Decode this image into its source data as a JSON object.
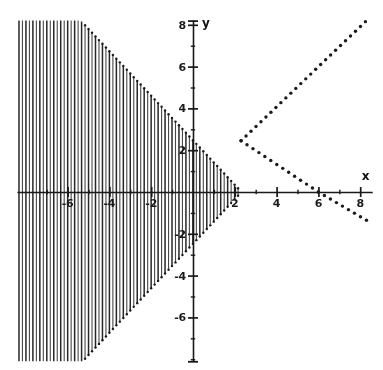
{
  "figure": {
    "kind": "math-plot",
    "background_color": "#ffffff",
    "ink_color": "#1a1a1a",
    "width": 383,
    "height": 370
  },
  "axes": {
    "x_axis_label": "x",
    "y_axis_label": "y",
    "origin_px": {
      "x": 193,
      "y": 192
    },
    "pixels_per_unit": 20.9,
    "x_labels": [
      {
        "value": -6,
        "text": "-6"
      },
      {
        "value": -4,
        "text": "-4"
      },
      {
        "value": -2,
        "text": "-2"
      },
      {
        "value": 2,
        "text": "2"
      },
      {
        "value": 4,
        "text": "4"
      },
      {
        "value": 6,
        "text": "6"
      },
      {
        "value": 8,
        "text": "8"
      }
    ],
    "y_labels": [
      {
        "value": 8,
        "text": "8"
      },
      {
        "value": 6,
        "text": "6"
      },
      {
        "value": 4,
        "text": "4"
      },
      {
        "value": 2,
        "text": "2"
      },
      {
        "value": -2,
        "text": "-2"
      },
      {
        "value": -4,
        "text": "-4"
      },
      {
        "value": -6,
        "text": "-6"
      }
    ],
    "x_major_ticks": [
      -6,
      -4,
      -2,
      2,
      4,
      6,
      8
    ],
    "x_minor_ticks": [
      -7,
      -5,
      -3,
      -1,
      1,
      3,
      5,
      7
    ],
    "y_major_ticks": [
      8,
      6,
      4,
      2,
      -2,
      -4,
      -6
    ],
    "y_minor_ticks": [
      7,
      5,
      3,
      1,
      -1,
      -3,
      -5,
      -7,
      -8
    ],
    "x_axis_span": [
      -8.4,
      8.6
    ],
    "y_axis_span": [
      -8.1,
      8.2
    ]
  },
  "chart_data": {
    "type": "line",
    "title": "",
    "xlabel": "x",
    "ylabel": "y",
    "xlim": [
      -8.4,
      8.6
    ],
    "ylim": [
      -8.1,
      8.2
    ],
    "grid": false,
    "legend": "none",
    "series": [
      {
        "name": "oscillating-function",
        "style": "solid-dense-oscillation",
        "description": "Rapidly oscillating curve whose amplitude decreases linearly from left to right, collapsing to a single point near x = 2.3. Drawn so densely that it reads as a filled cone of vertical strokes.",
        "x_start": -8.35,
        "x_end": 2.3,
        "envelope_zero_x": 2.3,
        "envelope_slope": -0.94,
        "amplitude_at_x_start": 10.0,
        "amplitude_at_x_minus_8": 7.9,
        "amplitude_at_x_minus_4": 5.9,
        "amplitude_at_x_0": 2.45,
        "oscillation_count": 64,
        "clipped_top": 8.2,
        "clipped_bottom": -8.1
      },
      {
        "name": "upper-envelope-dotted",
        "style": "dotted",
        "description": "Ascending dotted straight line from the convergence point up to the top-right corner.",
        "points": [
          [
            2.3,
            2.45
          ],
          [
            8.25,
            8.15
          ]
        ],
        "dot_spacing_px": 7,
        "dot_radius_px": 1.7
      },
      {
        "name": "lower-envelope-dotted",
        "style": "dotted",
        "description": "Descending dotted straight line from the convergence point through the x-axis at x = 6 and down to about y = -1.35 at x = 8.3.",
        "points": [
          [
            2.3,
            2.45
          ],
          [
            6.0,
            0.0
          ],
          [
            8.3,
            -1.35
          ]
        ],
        "x_intercept": 6.0,
        "dot_spacing_px": 7,
        "dot_radius_px": 1.7
      }
    ]
  }
}
